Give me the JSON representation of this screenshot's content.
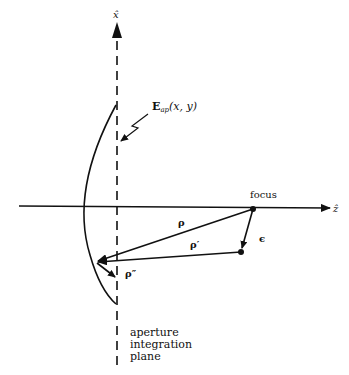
{
  "diagram": {
    "axes": {
      "x_axis_label": "x̂",
      "z_axis_label": "ẑ"
    },
    "labels": {
      "focus": "focus",
      "field": "E",
      "field_sub": "ap",
      "field_args": "(x, y)",
      "rho": "ρ",
      "rho_prime": "ρ′",
      "rho_double_prime": "ρ″",
      "epsilon": "ϵ",
      "plane_line1": "aperture",
      "plane_line2": "integration",
      "plane_line3": "plane"
    },
    "colors": {
      "ink": "#111111",
      "background": "#ffffff"
    }
  }
}
